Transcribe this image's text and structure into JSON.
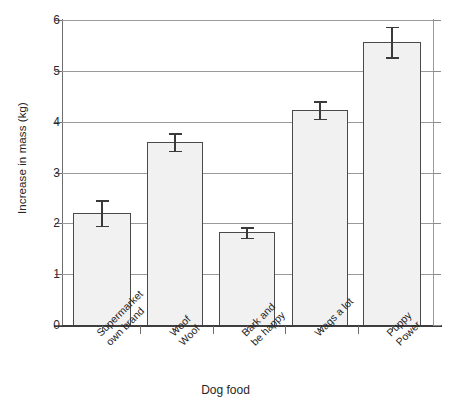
{
  "chart_data": {
    "type": "bar",
    "title": "",
    "xlabel": "Dog food",
    "ylabel": "Increase in mass (kg)",
    "categories": [
      "Supermarket own brand",
      "Woof Woof",
      "Bark and be happy",
      "Wags a lot",
      "Puppy Power"
    ],
    "category_lines": [
      [
        "Supermarket",
        "own brand"
      ],
      [
        "Woof",
        "Woof"
      ],
      [
        "Bark and",
        "be happy"
      ],
      [
        "Wags a lot",
        ""
      ],
      [
        "Puppy",
        "Power"
      ]
    ],
    "values": [
      2.2,
      3.6,
      1.82,
      4.23,
      5.57
    ],
    "errors": [
      0.25,
      0.17,
      0.1,
      0.17,
      0.3
    ],
    "error_low": [
      1.95,
      3.43,
      1.72,
      4.06,
      5.27
    ],
    "error_high": [
      2.45,
      3.77,
      1.92,
      4.4,
      5.87
    ],
    "ylim": [
      0,
      6
    ],
    "yticks": [
      0,
      1,
      2,
      3,
      4,
      5,
      6
    ],
    "ytick_labels": [
      "0",
      "1",
      "2",
      "3",
      "4",
      "5",
      "6"
    ],
    "grid": true,
    "grid_axis": "y",
    "legend": false,
    "bar_fill_color": "#f1f1f1",
    "bar_edge_color": "#4a4a4a",
    "error_color": "#3a3a3a",
    "grid_color": "#9a9a9a",
    "axis_color": "#3d3d3d"
  },
  "caption": {
    "bottom_text_fragment": ""
  }
}
